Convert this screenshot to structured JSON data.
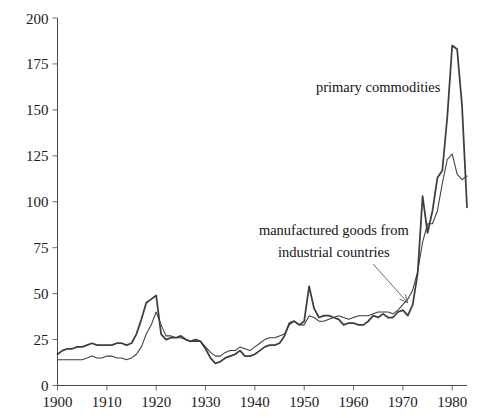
{
  "chart_data": {
    "type": "line",
    "title": "",
    "subtitle": "",
    "xlabel": "",
    "ylabel": "",
    "xlim": [
      1900,
      1983
    ],
    "ylim": [
      0,
      200
    ],
    "grid": false,
    "legend_position": "inline-annotations",
    "x_ticks": [
      1900,
      1910,
      1920,
      1930,
      1940,
      1950,
      1960,
      1970,
      1980
    ],
    "x_tick_labels": [
      "1900",
      "1910",
      "1920",
      "1930",
      "1940",
      "1950",
      "1960",
      "1970",
      "1980"
    ],
    "y_ticks": [
      0,
      25,
      50,
      75,
      100,
      125,
      150,
      175,
      200
    ],
    "y_tick_labels": [
      "0",
      "25",
      "50",
      "75",
      "100",
      "125",
      "150",
      "175",
      "200"
    ],
    "annotations": [
      {
        "name": "primary-commodities-label",
        "text": "primary commodities",
        "x": 1965,
        "y": 160,
        "anchor": "middle"
      },
      {
        "name": "manufactured-goods-label-line1",
        "text": "manufactured goods from",
        "x": 1956,
        "y": 82,
        "anchor": "middle"
      },
      {
        "name": "manufactured-goods-label-line2",
        "text": "industrial countries",
        "x": 1956,
        "y": 70,
        "anchor": "middle"
      }
    ],
    "arrow": {
      "name": "manufactured-goods-pointer",
      "from_x": 1964,
      "from_y": 66,
      "to_x": 1971,
      "to_y": 45
    },
    "series": [
      {
        "name": "primary commodities",
        "stroke": "#3d3d3d",
        "width": 1.75,
        "x": [
          1900,
          1901,
          1902,
          1903,
          1904,
          1905,
          1906,
          1907,
          1908,
          1909,
          1910,
          1911,
          1912,
          1913,
          1914,
          1915,
          1916,
          1917,
          1918,
          1919,
          1920,
          1921,
          1922,
          1923,
          1924,
          1925,
          1926,
          1927,
          1928,
          1929,
          1930,
          1931,
          1932,
          1933,
          1934,
          1935,
          1936,
          1937,
          1938,
          1939,
          1940,
          1941,
          1942,
          1943,
          1944,
          1945,
          1946,
          1947,
          1948,
          1949,
          1950,
          1951,
          1952,
          1953,
          1954,
          1955,
          1956,
          1957,
          1958,
          1959,
          1960,
          1961,
          1962,
          1963,
          1964,
          1965,
          1966,
          1967,
          1968,
          1969,
          1970,
          1971,
          1972,
          1973,
          1974,
          1975,
          1976,
          1977,
          1978,
          1979,
          1980,
          1981,
          1982,
          1983
        ],
        "values": [
          17,
          19,
          20,
          20,
          21,
          21,
          22,
          23,
          22,
          22,
          22,
          22,
          23,
          23,
          22,
          23,
          28,
          36,
          45,
          47,
          49,
          28,
          25,
          26,
          26,
          27,
          25,
          24,
          25,
          24,
          20,
          15,
          12,
          13,
          15,
          16,
          17,
          19,
          16,
          16,
          17,
          19,
          21,
          22,
          22,
          23,
          27,
          34,
          35,
          33,
          35,
          54,
          42,
          37,
          38,
          38,
          37,
          36,
          33,
          34,
          34,
          33,
          33,
          35,
          38,
          37,
          39,
          37,
          37,
          40,
          41,
          38,
          44,
          61,
          103,
          83,
          95,
          113,
          117,
          146,
          185,
          183,
          152,
          97
        ]
      },
      {
        "name": "manufactured goods from industrial countries",
        "stroke": "#3d3d3d",
        "width": 1.05,
        "x": [
          1900,
          1901,
          1902,
          1903,
          1904,
          1905,
          1906,
          1907,
          1908,
          1909,
          1910,
          1911,
          1912,
          1913,
          1914,
          1915,
          1916,
          1917,
          1918,
          1919,
          1920,
          1921,
          1922,
          1923,
          1924,
          1925,
          1926,
          1927,
          1928,
          1929,
          1930,
          1931,
          1932,
          1933,
          1934,
          1935,
          1936,
          1937,
          1938,
          1939,
          1940,
          1941,
          1942,
          1943,
          1944,
          1945,
          1946,
          1947,
          1948,
          1949,
          1950,
          1951,
          1952,
          1953,
          1954,
          1955,
          1956,
          1957,
          1958,
          1959,
          1960,
          1961,
          1962,
          1963,
          1964,
          1965,
          1966,
          1967,
          1968,
          1969,
          1970,
          1971,
          1972,
          1973,
          1974,
          1975,
          1976,
          1977,
          1978,
          1979,
          1980,
          1981,
          1982,
          1983
        ],
        "values": [
          14,
          14,
          14,
          14,
          14,
          14,
          15,
          16,
          15,
          15,
          16,
          16,
          15,
          15,
          14,
          15,
          17,
          21,
          28,
          33,
          40,
          33,
          27,
          27,
          26,
          26,
          25,
          24,
          24,
          24,
          21,
          18,
          16,
          16,
          18,
          19,
          19,
          21,
          20,
          19,
          21,
          23,
          25,
          26,
          26,
          27,
          28,
          33,
          35,
          33,
          33,
          38,
          37,
          35,
          35,
          36,
          37,
          38,
          37,
          36,
          37,
          38,
          38,
          38,
          39,
          40,
          40,
          40,
          39,
          41,
          44,
          47,
          52,
          62,
          78,
          88,
          88,
          95,
          110,
          123,
          126,
          115,
          112,
          114
        ]
      }
    ]
  }
}
